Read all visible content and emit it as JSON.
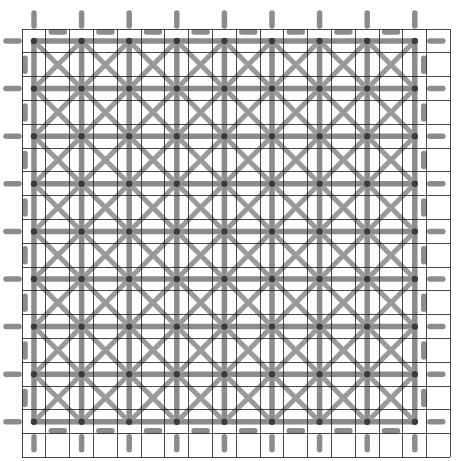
{
  "figure": {
    "title": "Lattice truss mesh over background grid",
    "kind": "diagram",
    "width": 474,
    "height": 461,
    "background_color": "#ffffff"
  },
  "background_grid": {
    "name": "thin-black-reference-grid",
    "color": "#1a1a1a",
    "line_width": 0.8,
    "x_start": 22,
    "y_start": 29,
    "spacing": 23.8,
    "vertical_line_count": 19,
    "horizontal_line_count": 19,
    "x_end": 450.4,
    "y_end": 457.4,
    "visible": true
  },
  "lattice": {
    "name": "gray-truss-lattice",
    "member_color": "#8c8c8c",
    "member_color_secondary": "#9a9a9a",
    "node_color": "#3a3a3a",
    "member_width": 5.5,
    "diagonal_width": 5.0,
    "node_radius": 3.2,
    "node_spacing": 47.6,
    "node_x_start": 34,
    "node_y_start": 41,
    "node_columns": 9,
    "node_rows": 9,
    "members": [
      "horizontal",
      "vertical",
      "diagonal-down-right",
      "diagonal-up-right"
    ],
    "boundary_stubs": {
      "name": "edge-stub-segments",
      "color": "#8c8c8c",
      "length": 13,
      "width": 5.5,
      "edges": [
        "top",
        "bottom",
        "left",
        "right"
      ],
      "offset": 15
    }
  },
  "chart_data": {
    "type": "diagram",
    "title": "Lattice truss mesh over background grid",
    "grid": {
      "nx": 19,
      "ny": 19,
      "spacing_px": 23.8
    },
    "nodes": {
      "nx": 9,
      "ny": 9,
      "spacing_px": 47.6,
      "total": 81
    },
    "legend": [],
    "xlabel": "",
    "ylabel": ""
  }
}
